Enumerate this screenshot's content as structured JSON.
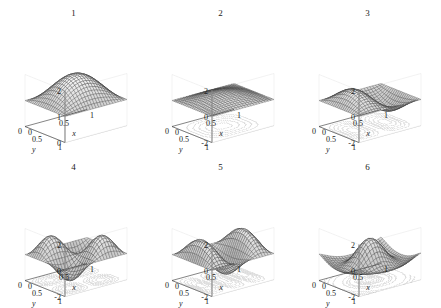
{
  "figure": {
    "caption": "",
    "rows": 2,
    "columns": 3,
    "background": "#ffffff"
  },
  "chart_data": {
    "type": "surface",
    "title": "",
    "xlabel": "x",
    "ylabel": "y",
    "zlabel": "",
    "xlim": [
      0,
      1
    ],
    "ylim": [
      0,
      1
    ],
    "grid": true,
    "legend": "none",
    "projection": "3d",
    "colormap": "gray",
    "shared_xticks": [
      "0",
      "0.5",
      "1"
    ],
    "shared_yticks": [
      "1",
      "0.5",
      "0"
    ],
    "panels": [
      {
        "title": "1",
        "zticks": [
          "2",
          "1",
          "0"
        ],
        "zlim": [
          0,
          2
        ],
        "xticks": [
          "0",
          "0.5",
          "1"
        ],
        "yticks": [
          "1",
          "0.5",
          "0"
        ],
        "xlabel": "x",
        "ylabel": "y",
        "modes": [
          1,
          1
        ],
        "amplitude": 1.0,
        "offset": 1.0,
        "contours": false,
        "description": "single positive dome, mode (1,1)"
      },
      {
        "title": "2",
        "zticks": [
          "2",
          "0",
          "-2"
        ],
        "zlim": [
          -2,
          2
        ],
        "xticks": [
          "0",
          "0.5",
          "1"
        ],
        "yticks": [
          "1",
          "0.5",
          "0"
        ],
        "xlabel": "x",
        "ylabel": "y",
        "modes": [
          1,
          1
        ],
        "amplitude": 0.55,
        "offset": 0.0,
        "contours": true,
        "description": "shallow single depression, mode (1,1) negative"
      },
      {
        "title": "3",
        "zticks": [
          "2",
          "0",
          "-2"
        ],
        "zlim": [
          -2,
          2
        ],
        "xticks": [
          "0",
          "0.5",
          "1"
        ],
        "yticks": [
          "1",
          "0.5",
          "0"
        ],
        "xlabel": "x",
        "ylabel": "y",
        "modes": [
          2,
          1
        ],
        "amplitude": 1.1,
        "offset": 0.0,
        "contours": true,
        "description": "one peak one valley, mode (2,1)"
      },
      {
        "title": "4",
        "zticks": [
          "2",
          "0",
          "-2"
        ],
        "zlim": [
          -2,
          2
        ],
        "xticks": [
          "0",
          "0.5",
          "1"
        ],
        "yticks": [
          "1",
          "0.5",
          "0"
        ],
        "xlabel": "x",
        "ylabel": "y",
        "modes": [
          2,
          2
        ],
        "amplitude": 1.4,
        "offset": 0.0,
        "contours": true,
        "description": "checkerboard two peaks two valleys, mode (2,2)"
      },
      {
        "title": "5",
        "zticks": [
          "2",
          "0",
          "-2"
        ],
        "zlim": [
          -2,
          2
        ],
        "xticks": [
          "0",
          "0.5",
          "1"
        ],
        "yticks": [
          "1",
          "0.5",
          "0"
        ],
        "xlabel": "x",
        "ylabel": "y",
        "modes": [
          3,
          1
        ],
        "amplitude": 1.5,
        "offset": 0.0,
        "contours": true,
        "description": "three alternating ridges, mode (3,1)"
      },
      {
        "title": "6",
        "zticks": [
          "2",
          "0",
          "-2"
        ],
        "zlim": [
          -2,
          2
        ],
        "xticks": [
          "0",
          "0.5",
          "1"
        ],
        "yticks": [
          "1",
          "0.5",
          "0"
        ],
        "xlabel": "x",
        "ylabel": "y",
        "modes": [
          3,
          3
        ],
        "amplitude": 1.2,
        "offset": 0.0,
        "contours": true,
        "description": "central dome with surrounding ring, mode (3,3) radial"
      }
    ]
  }
}
